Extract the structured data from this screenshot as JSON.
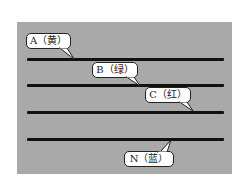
{
  "diagram": {
    "title": "",
    "panel_color": "#a9a9a9",
    "wire_color": "#111111",
    "wires": [
      {
        "id": "A",
        "label": "A（黄）",
        "color_name": "黄"
      },
      {
        "id": "B",
        "label": "B（绿）",
        "color_name": "绿"
      },
      {
        "id": "C",
        "label": "C（红）",
        "color_name": "红"
      },
      {
        "id": "N",
        "label": "N（蓝）",
        "color_name": "蓝"
      }
    ]
  }
}
